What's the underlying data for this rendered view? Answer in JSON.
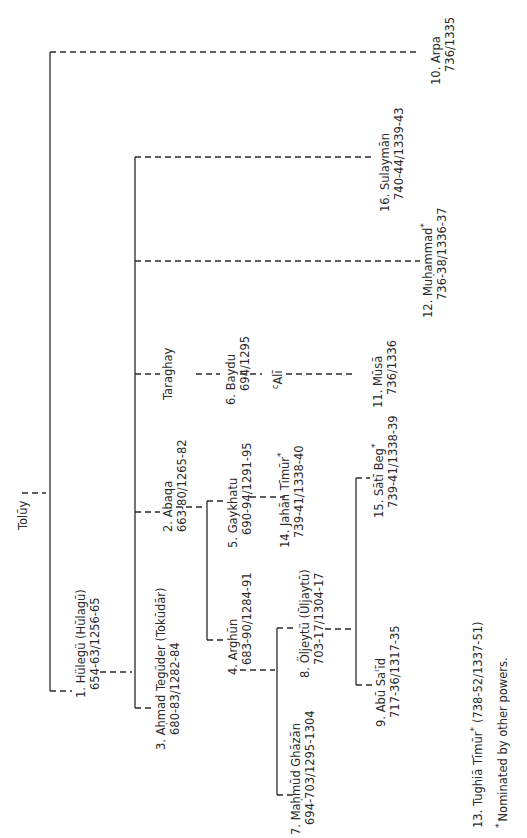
{
  "diagram": {
    "type": "genealogical-tree",
    "orientation": "rotated-90-ccw",
    "root": {
      "name": "Tolūy"
    },
    "nodes": [
      {
        "id": "hulegu",
        "name": "1. Hülegü (Hūlagū)",
        "dates": "654-63/1256-65"
      },
      {
        "id": "abaqa",
        "name": "2. Abaqa",
        "dates": "663-80/1265-82"
      },
      {
        "id": "ahmad",
        "name": "3. Aḥmad Tegüder (Tokūdār)",
        "dates": "680-83/1282-84"
      },
      {
        "id": "arghun",
        "name": "4. Arghūn",
        "dates": "683-90/1284-91"
      },
      {
        "id": "gaykhatu",
        "name": "5. Gaykhatu",
        "dates": "690-94/1291-95"
      },
      {
        "id": "baydu",
        "name": "6. Baydu",
        "dates": "694/1295"
      },
      {
        "id": "ghazan",
        "name": "7. Maḥmūd Ghāzān",
        "dates": "694-703/1295-1304"
      },
      {
        "id": "oljeytu",
        "name": "8. Öljeytü (Ūljaytū)",
        "dates": "703-17/1304-17"
      },
      {
        "id": "abusaid",
        "name": "9. Abū Saʿīd",
        "dates": "717-36/1317-35"
      },
      {
        "id": "arpa",
        "name": "10. Arpa",
        "dates": "736/1335"
      },
      {
        "id": "musa",
        "name": "11. Mūsā",
        "dates": "736/1336"
      },
      {
        "id": "muhammad",
        "name": "12. Muḥammad",
        "star": "*",
        "dates": "736-38/1336-37"
      },
      {
        "id": "jahan",
        "name": "14. Jahān Tīmūr",
        "star": "*",
        "dates": "739-41/1338-40"
      },
      {
        "id": "sati",
        "name": "15. Sātī Beg",
        "star": "*",
        "dates": "739-41/1338-39"
      },
      {
        "id": "sulayman",
        "name": "16. Sulaymān",
        "dates": "740-44/1339-43"
      },
      {
        "id": "taraghay",
        "name": "Taraghay"
      },
      {
        "id": "ali",
        "name": "ʿAlī",
        "prefix": "c",
        "main": "Alī"
      }
    ],
    "footnotes": {
      "tughia": "13. Tughiā Tīmūr",
      "tughia_star": "*",
      "tughia_dates": "(738-52/1337-51)",
      "star_symbol": "*",
      "nominated": "Nominated by other powers."
    }
  }
}
